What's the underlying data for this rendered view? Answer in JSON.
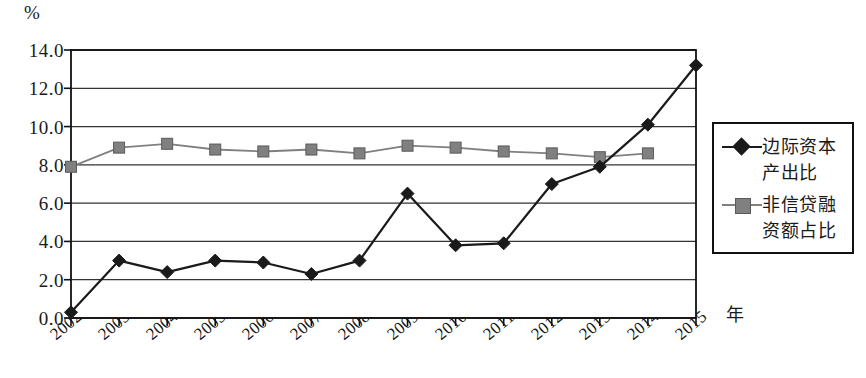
{
  "chart_data": {
    "type": "line",
    "title": "",
    "subtitle": "",
    "xlabel": "年",
    "ylabel": "%",
    "grid": true,
    "legend_position": "right",
    "xlim": [
      2002,
      2015
    ],
    "ylim": [
      0.0,
      14.0
    ],
    "ytick_step": 2.0,
    "categories": [
      "2002",
      "2003",
      "2004",
      "2005",
      "2006",
      "2007",
      "2008",
      "2009",
      "2010",
      "2011",
      "2012",
      "2013",
      "2014",
      "2015"
    ],
    "ytick_labels": [
      "0.0",
      "2.0",
      "4.0",
      "6.0",
      "8.0",
      "10.0",
      "12.0",
      "14.0"
    ],
    "series": [
      {
        "name": "边际资本\n产出比",
        "marker": "diamond",
        "color": "#1a1a1a",
        "values": [
          0.3,
          3.0,
          2.4,
          3.0,
          2.9,
          2.3,
          3.0,
          6.5,
          3.8,
          3.9,
          7.0,
          7.9,
          10.1,
          13.2
        ]
      },
      {
        "name": "非信贷融\n资额占比",
        "marker": "square",
        "color": "#808080",
        "values": [
          7.9,
          8.9,
          9.1,
          8.8,
          8.7,
          8.8,
          8.6,
          9.0,
          8.9,
          8.7,
          8.6,
          8.4,
          8.6,
          null
        ]
      }
    ]
  },
  "axis": {
    "unit": "%",
    "x_axis_caption": "年"
  },
  "legend": {
    "entries": [
      {
        "label": "边际资本\n产出比",
        "marker": "diamond",
        "color": "#1a1a1a"
      },
      {
        "label": "非信贷融\n资额占比",
        "marker": "square",
        "color": "#808080"
      }
    ]
  }
}
